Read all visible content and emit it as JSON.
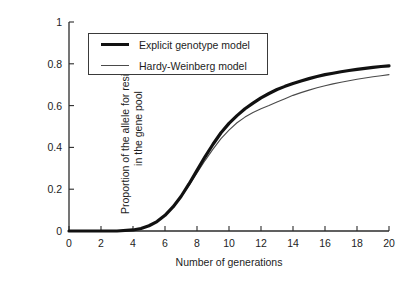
{
  "chart_data": {
    "type": "line",
    "title": "",
    "xlabel": "Number of generations",
    "ylabel": "Proportion of the allele for resistance in the gene pool",
    "ylabel_line1": "Proportion of the allele for resistance",
    "ylabel_line2": "in the gene pool",
    "xlim": [
      0,
      20
    ],
    "ylim": [
      0,
      1
    ],
    "xticks": [
      0,
      2,
      4,
      6,
      8,
      10,
      12,
      14,
      16,
      18,
      20
    ],
    "xtick_labels": [
      "0",
      "2",
      "4",
      "6",
      "8",
      "10",
      "12",
      "14",
      "16",
      "18",
      "20"
    ],
    "yticks": [
      0,
      0.2,
      0.4,
      0.6,
      0.8,
      1
    ],
    "ytick_labels": [
      "0",
      "0.2",
      "0.4",
      "0.6",
      "0.8",
      "1"
    ],
    "grid": false,
    "legend_position": "upper-left-inside",
    "x": [
      0,
      1,
      2,
      3,
      4,
      4.5,
      5,
      5.5,
      6,
      6.5,
      7,
      7.5,
      8,
      8.5,
      9,
      9.5,
      10,
      10.5,
      11,
      11.5,
      12,
      12.5,
      13,
      13.5,
      14,
      14.5,
      15,
      15.5,
      16,
      16.5,
      17,
      17.5,
      18,
      18.5,
      19,
      19.5,
      20
    ],
    "series": [
      {
        "name": "Explicit genotype model",
        "color": "#111111",
        "linewidth": 3.2,
        "values": [
          0.0,
          0.0,
          0.0,
          0.0,
          0.005,
          0.012,
          0.025,
          0.045,
          0.075,
          0.115,
          0.165,
          0.225,
          0.29,
          0.355,
          0.415,
          0.47,
          0.515,
          0.552,
          0.585,
          0.612,
          0.637,
          0.658,
          0.677,
          0.692,
          0.706,
          0.718,
          0.729,
          0.739,
          0.748,
          0.755,
          0.762,
          0.768,
          0.773,
          0.778,
          0.783,
          0.787,
          0.79
        ]
      },
      {
        "name": "Hardy-Weinberg model",
        "color": "#4a4a4a",
        "linewidth": 1.1,
        "values": [
          0.0,
          0.0,
          0.0,
          0.0,
          0.005,
          0.012,
          0.025,
          0.045,
          0.075,
          0.115,
          0.162,
          0.218,
          0.278,
          0.337,
          0.392,
          0.442,
          0.483,
          0.518,
          0.545,
          0.567,
          0.585,
          0.6,
          0.617,
          0.633,
          0.649,
          0.662,
          0.674,
          0.685,
          0.695,
          0.704,
          0.712,
          0.719,
          0.726,
          0.732,
          0.738,
          0.743,
          0.748
        ]
      }
    ]
  },
  "legend": {
    "items": [
      {
        "label": "Explicit genotype model",
        "style": "thick"
      },
      {
        "label": "Hardy-Weinberg model",
        "style": "thin"
      }
    ]
  },
  "axes": {
    "x_title": "Number of generations",
    "y_title_line1": "Proportion of the allele for resistance",
    "y_title_line2": "in the gene pool"
  },
  "colors": {
    "background": "#ffffff",
    "axis": "#2b2b2b",
    "series_primary": "#111111",
    "series_secondary": "#4a4a4a",
    "text": "#1d1d1d"
  }
}
